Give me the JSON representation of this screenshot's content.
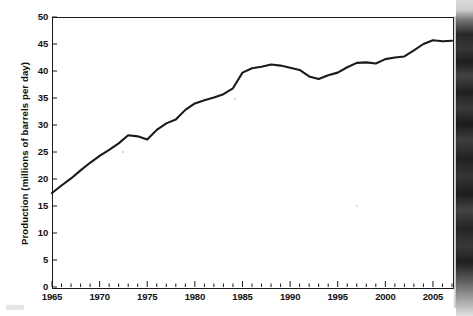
{
  "chart_data": {
    "type": "line",
    "title": "",
    "xlabel": "",
    "ylabel": "Production (millions of barrels per day)",
    "xlim": [
      1965,
      2007
    ],
    "ylim": [
      0,
      50
    ],
    "grid": false,
    "legend": "none",
    "y_ticks": [
      0,
      5,
      10,
      15,
      20,
      25,
      30,
      35,
      40,
      45,
      50
    ],
    "y_tick_labels": [
      "0",
      "5",
      "10",
      "15",
      "20",
      "25",
      "30",
      "35",
      "40",
      "45",
      "50"
    ],
    "x_ticks": [
      1965,
      1970,
      1975,
      1980,
      1985,
      1990,
      1995,
      2000,
      2005
    ],
    "x_tick_labels": [
      "1965",
      "1970",
      "1975",
      "1980",
      "1985",
      "1990",
      "1995",
      "2000",
      "2005"
    ],
    "x_minor_tick_interval": 1,
    "series": [
      {
        "name": "World oil production",
        "color": "#1a1a1a",
        "x": [
          1965,
          1966,
          1967,
          1968,
          1969,
          1970,
          1971,
          1972,
          1973,
          1974,
          1975,
          1976,
          1977,
          1978,
          1979,
          1980,
          1981,
          1982,
          1983,
          1984,
          1985,
          1986,
          1987,
          1988,
          1989,
          1990,
          1991,
          1992,
          1993,
          1994,
          1995,
          1996,
          1997,
          1998,
          1999,
          2000,
          2001,
          2002,
          2003,
          2004,
          2005,
          2006,
          2007
        ],
        "values": [
          17.4,
          18.8,
          20.1,
          21.6,
          23.0,
          24.3,
          25.4,
          26.6,
          28.1,
          27.9,
          27.3,
          29.1,
          30.3,
          31.0,
          32.8,
          34.0,
          34.6,
          35.1,
          35.7,
          36.8,
          39.7,
          40.5,
          40.8,
          41.2,
          41.0,
          40.6,
          40.2,
          39.0,
          38.5,
          39.2,
          39.7,
          40.7,
          41.5,
          41.6,
          41.4,
          42.2,
          42.5,
          42.7,
          43.8,
          45.0,
          45.7,
          45.5,
          45.6
        ]
      }
    ]
  },
  "axes": {
    "y_title": "Production (millions of barrels per day)"
  }
}
